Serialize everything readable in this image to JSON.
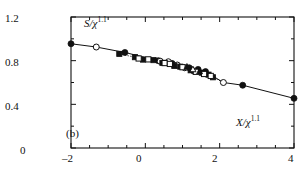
{
  "figure": {
    "panel_label": "(b)",
    "background_color": "#ffffff",
    "ink_color": "#111111"
  },
  "axes": {
    "y_title_num": "S",
    "y_title_slash": "/",
    "y_title_den": "χ",
    "y_title_exp": "1.1",
    "x_title_num": "X",
    "x_title_slash": "/",
    "x_title_den": "χ",
    "x_title_exp": "1.1",
    "y_ticks": [
      "1.2",
      "0.8",
      "0.4",
      "0"
    ],
    "x_ticks": [
      "–2",
      "0",
      "2",
      "4"
    ]
  },
  "chart_data": {
    "type": "scatter",
    "title": "",
    "subtitle": "",
    "panel": "(b)",
    "xlabel": "X/χ^1.1",
    "ylabel": "S/χ^1.1",
    "xlim": [
      -2,
      4
    ],
    "ylim": [
      0,
      1.2
    ],
    "x_ticks": [
      -2,
      0,
      2,
      4
    ],
    "y_ticks": [
      0,
      0.4,
      0.8,
      1.2
    ],
    "x_minor_ticks": [
      -1.5,
      -1,
      -0.5,
      0.5,
      1,
      1.5,
      2.5,
      3,
      3.5
    ],
    "y_minor_ticks": [
      0.2,
      0.6,
      1.0
    ],
    "grid": false,
    "legend": null,
    "legend_position": "none",
    "annotations": [
      {
        "text": "(b)",
        "x": -1.75,
        "y": 0.1
      }
    ],
    "series": [
      {
        "name": "filled-circle",
        "marker": "filled-circle",
        "x": [
          -2.0,
          -0.55,
          0.35,
          0.72,
          1.18,
          1.42,
          1.62,
          2.62,
          4.0
        ],
        "y": [
          0.955,
          0.875,
          0.8,
          0.775,
          0.735,
          0.72,
          0.7,
          0.575,
          0.455
        ]
      },
      {
        "name": "open-circle",
        "marker": "open-circle",
        "x": [
          -1.32,
          0.4,
          0.62,
          0.86,
          1.06,
          1.3,
          2.1
        ],
        "y": [
          0.925,
          0.795,
          0.79,
          0.76,
          0.735,
          0.705,
          0.6
        ]
      },
      {
        "name": "filled-square",
        "marker": "filled-square",
        "x": [
          -0.7,
          -0.28,
          -0.06,
          0.22,
          0.46,
          0.78,
          0.94,
          1.22,
          1.52,
          1.7,
          1.82
        ],
        "y": [
          0.862,
          0.832,
          0.81,
          0.805,
          0.78,
          0.752,
          0.745,
          0.712,
          0.69,
          0.672,
          0.648
        ]
      },
      {
        "name": "open-square",
        "marker": "open-square",
        "x": [
          -0.18,
          0.08,
          0.52,
          0.66,
          1.0,
          1.36,
          1.58,
          1.76
        ],
        "y": [
          0.82,
          0.812,
          0.778,
          0.77,
          0.74,
          0.698,
          0.678,
          0.66
        ]
      },
      {
        "name": "filled-triangle",
        "marker": "filled-triangle",
        "x": [
          1.12,
          1.46
        ],
        "y": [
          0.742,
          0.7
        ]
      },
      {
        "name": "open-triangle",
        "marker": "open-triangle",
        "x": [
          1.28
        ],
        "y": [
          0.718
        ]
      }
    ],
    "curves": [
      {
        "name": "solid-guide-line",
        "style": "solid",
        "x": [
          -2.0,
          -1.32,
          -0.55,
          0.35,
          0.72,
          1.18,
          1.62,
          2.1,
          2.62,
          4.0
        ],
        "y": [
          0.955,
          0.925,
          0.875,
          0.8,
          0.775,
          0.735,
          0.7,
          0.6,
          0.575,
          0.455
        ]
      },
      {
        "name": "dotted-guide-line",
        "style": "dotted",
        "x": [
          -0.7,
          -0.28,
          0.08,
          0.46,
          0.78,
          1.0,
          1.22,
          1.52,
          1.82,
          2.1
        ],
        "y": [
          0.862,
          0.832,
          0.812,
          0.78,
          0.752,
          0.74,
          0.712,
          0.69,
          0.648,
          0.6
        ]
      }
    ]
  }
}
